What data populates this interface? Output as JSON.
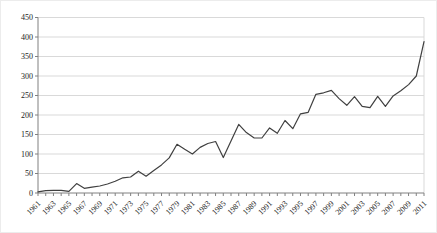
{
  "chart_data": {
    "type": "line",
    "title": "",
    "xlabel": "",
    "ylabel": "",
    "ylim": [
      0,
      450
    ],
    "ytick_step": 50,
    "x_label_step": 2,
    "grid": "horizontal",
    "legend": "none",
    "markers": "none",
    "colors": {
      "line": "#404040",
      "grid": "#d9d9d9",
      "axis": "#808080",
      "text": "#1a1a1a",
      "background": "#ffffff"
    },
    "y_tick_labels": [
      "0",
      "50",
      "100",
      "150",
      "200",
      "250",
      "300",
      "350",
      "400",
      "450"
    ],
    "x_tick_labels": [
      "1961",
      "1963",
      "1965",
      "1967",
      "1969",
      "1971",
      "1973",
      "1975",
      "1977",
      "1979",
      "1981",
      "1983",
      "1985",
      "1987",
      "1989",
      "1991",
      "1993",
      "1995",
      "1997",
      "1999",
      "2001",
      "2003",
      "2005",
      "2007",
      "2009",
      "2011"
    ],
    "x": [
      1961,
      1962,
      1963,
      1964,
      1965,
      1966,
      1967,
      1968,
      1969,
      1970,
      1971,
      1972,
      1973,
      1974,
      1975,
      1976,
      1977,
      1978,
      1979,
      1980,
      1981,
      1982,
      1983,
      1984,
      1985,
      1986,
      1987,
      1988,
      1989,
      1990,
      1991,
      1992,
      1993,
      1994,
      1995,
      1996,
      1997,
      1998,
      1999,
      2000,
      2001,
      2002,
      2003,
      2004,
      2005,
      2006,
      2007,
      2008,
      2009,
      2010,
      2011
    ],
    "series": [
      {
        "name": "value",
        "values": [
          3,
          6,
          7,
          7,
          4,
          24,
          12,
          15,
          18,
          23,
          30,
          39,
          41,
          56,
          43,
          58,
          72,
          90,
          125,
          112,
          100,
          117,
          127,
          132,
          91,
          133,
          176,
          155,
          141,
          141,
          167,
          153,
          186,
          165,
          203,
          207,
          253,
          257,
          263,
          242,
          225,
          247,
          222,
          219,
          248,
          222,
          249,
          262,
          278,
          300,
          388
        ]
      }
    ]
  }
}
